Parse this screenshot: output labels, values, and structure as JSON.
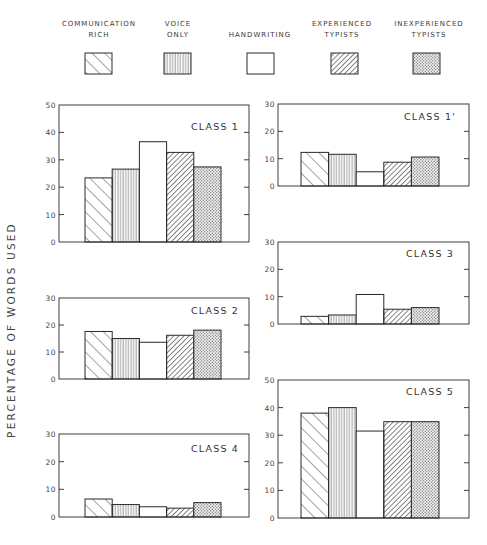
{
  "legend": [
    {
      "id": "communication_rich",
      "label": "COMMUNICATION\nRICH",
      "pattern": "diag-down-wide"
    },
    {
      "id": "voice_only",
      "label": "VOICE\nONLY",
      "pattern": "vertical-lines"
    },
    {
      "id": "handwriting",
      "label": "HANDWRITING",
      "pattern": "blank"
    },
    {
      "id": "experienced_typists",
      "label": "EXPERIENCED\nTYPISTS",
      "pattern": "diag-up-dense"
    },
    {
      "id": "inexperienced_typists",
      "label": "INEXPERIENCED\nTYPISTS",
      "pattern": "crosshatch-dots"
    }
  ],
  "y_axis_label": "PERCENTAGE OF WORDS USED",
  "colors": {
    "ink": "#2a2a2a",
    "background": "#ffffff"
  },
  "chart_data": [
    {
      "type": "bar",
      "title": "CLASS 1",
      "categories": [
        "Communication Rich",
        "Voice Only",
        "Handwriting",
        "Experienced Typists",
        "Inexperienced Typists"
      ],
      "values": [
        23.4,
        26.6,
        36.6,
        32.7,
        27.4
      ],
      "ylabel": "Percentage of Words Used",
      "ylim": [
        0,
        50
      ],
      "yticks": [
        0,
        10,
        20,
        30,
        40,
        50
      ],
      "grid": false,
      "legend_position": "top"
    },
    {
      "type": "bar",
      "title": "CLASS 1'",
      "categories": [
        "Communication Rich",
        "Voice Only",
        "Handwriting",
        "Experienced Typists",
        "Inexperienced Typists"
      ],
      "values": [
        12.3,
        11.6,
        5.2,
        8.7,
        10.6
      ],
      "ylabel": "Percentage of Words Used",
      "ylim": [
        0,
        30
      ],
      "yticks": [
        0,
        10,
        20,
        30
      ],
      "grid": false
    },
    {
      "type": "bar",
      "title": "CLASS 2",
      "categories": [
        "Communication Rich",
        "Voice Only",
        "Handwriting",
        "Experienced Typists",
        "Inexperienced Typists"
      ],
      "values": [
        17.6,
        15.0,
        13.6,
        16.2,
        18.1
      ],
      "ylabel": "Percentage of Words Used",
      "ylim": [
        0,
        30
      ],
      "yticks": [
        0,
        10,
        20,
        30
      ],
      "grid": false
    },
    {
      "type": "bar",
      "title": "CLASS 3",
      "categories": [
        "Communication Rich",
        "Voice Only",
        "Handwriting",
        "Experienced Typists",
        "Inexperienced Typists"
      ],
      "values": [
        2.8,
        3.3,
        10.8,
        5.4,
        6.0
      ],
      "ylabel": "Percentage of Words Used",
      "ylim": [
        0,
        30
      ],
      "yticks": [
        0,
        10,
        20,
        30
      ],
      "grid": false
    },
    {
      "type": "bar",
      "title": "CLASS 4",
      "categories": [
        "Communication Rich",
        "Voice Only",
        "Handwriting",
        "Experienced Typists",
        "Inexperienced Typists"
      ],
      "values": [
        6.5,
        4.5,
        3.7,
        3.2,
        5.2
      ],
      "ylabel": "Percentage of Words Used",
      "ylim": [
        0,
        30
      ],
      "yticks": [
        0,
        10,
        20,
        30
      ],
      "grid": false
    },
    {
      "type": "bar",
      "title": "CLASS 5",
      "categories": [
        "Communication Rich",
        "Voice Only",
        "Handwriting",
        "Experienced Typists",
        "Inexperienced Typists"
      ],
      "values": [
        38.0,
        40.0,
        31.5,
        34.9,
        34.9
      ],
      "ylabel": "Percentage of Words Used",
      "ylim": [
        0,
        50
      ],
      "yticks": [
        0,
        10,
        20,
        30,
        40,
        50
      ],
      "grid": false
    }
  ]
}
